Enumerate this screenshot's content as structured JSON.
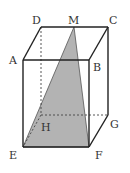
{
  "diagram": {
    "colors": {
      "edge": "#222222",
      "hidden_edge": "#444444",
      "shade": "#b3b3b3",
      "label": "#333333",
      "background": "#ffffff"
    },
    "vertices": {
      "A": {
        "label": "A",
        "x": 23,
        "y": 60,
        "lx": 9,
        "ly": 64
      },
      "B": {
        "label": "B",
        "x": 89,
        "y": 60,
        "lx": 93,
        "ly": 71
      },
      "C": {
        "label": "C",
        "x": 108,
        "y": 27,
        "lx": 109,
        "ly": 24
      },
      "D": {
        "label": "D",
        "x": 41,
        "y": 27,
        "lx": 32,
        "ly": 24
      },
      "E": {
        "label": "E",
        "x": 23,
        "y": 147,
        "lx": 9,
        "ly": 159
      },
      "F": {
        "label": "F",
        "x": 89,
        "y": 147,
        "lx": 95,
        "ly": 159
      },
      "G": {
        "label": "G",
        "x": 108,
        "y": 115,
        "lx": 110,
        "ly": 128
      },
      "H": {
        "label": "H",
        "x": 41,
        "y": 115,
        "lx": 41,
        "ly": 131
      },
      "M": {
        "label": "M",
        "x": 74,
        "y": 27,
        "lx": 68,
        "ly": 24
      }
    },
    "shaded_triangle": [
      "M",
      "E",
      "F"
    ],
    "solid_edges": [
      [
        "A",
        "B"
      ],
      [
        "B",
        "C"
      ],
      [
        "C",
        "D"
      ],
      [
        "D",
        "A"
      ],
      [
        "A",
        "E"
      ],
      [
        "B",
        "F"
      ],
      [
        "C",
        "G"
      ],
      [
        "E",
        "F"
      ],
      [
        "F",
        "G"
      ]
    ],
    "hidden_edges": [
      [
        "D",
        "H"
      ],
      [
        "H",
        "G"
      ],
      [
        "H",
        "E"
      ]
    ]
  }
}
